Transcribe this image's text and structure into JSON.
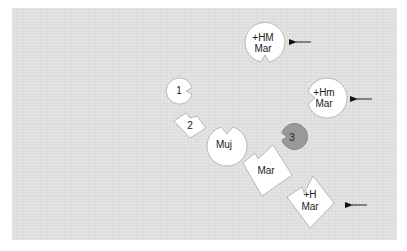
{
  "diagram": {
    "background": "#dcdcdc",
    "shape_fill": "#ffffff",
    "highlight_fill": "#999999",
    "nodes": [
      {
        "id": "hm-mar",
        "shape": "circle-notch-bottom",
        "line1": "+HM",
        "line2": "Mar",
        "arrow": true
      },
      {
        "id": "n1",
        "shape": "circle-notch-right",
        "line1": "1"
      },
      {
        "id": "hm-lower-mar",
        "shape": "circle-notch-left",
        "line1": "+Hm",
        "line2": "Mar",
        "arrow": true
      },
      {
        "id": "n2",
        "shape": "diamond-notch",
        "line1": "2"
      },
      {
        "id": "muj",
        "shape": "circle-notch-top",
        "line1": "Muj"
      },
      {
        "id": "n3",
        "shape": "circle-notch-left",
        "line1": "3",
        "highlighted": true
      },
      {
        "id": "mar",
        "shape": "diamond-notch",
        "line1": "Mar"
      },
      {
        "id": "h-mar",
        "shape": "diamond-notch",
        "line1": "+H",
        "line2": "Mar",
        "arrow": true
      }
    ]
  }
}
